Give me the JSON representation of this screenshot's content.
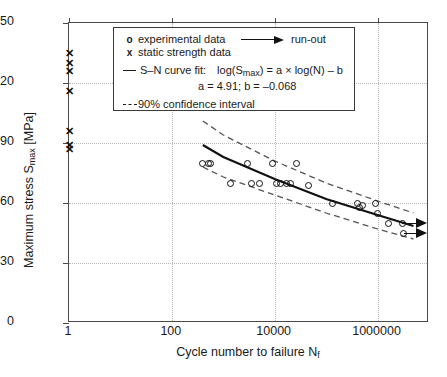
{
  "chart_data": {
    "type": "scatter",
    "title": "",
    "xlabel": "Cycle number to failure Nf",
    "ylabel": "Maximum stress Smax [MPa]",
    "xscale": "log",
    "xlim": [
      1,
      10000000
    ],
    "ylim": [
      0,
      150
    ],
    "xticks": [
      1,
      100,
      10000,
      1000000
    ],
    "xtick_labels": [
      "1",
      "100",
      "10000",
      "1000000"
    ],
    "yticks": [
      0,
      30,
      60,
      90,
      120,
      150
    ],
    "ytick_labels": [
      "0",
      "30",
      "60",
      "90",
      "120",
      "150"
    ],
    "grid": true,
    "legend_position": "top-center",
    "series": [
      {
        "name": "experimental data",
        "marker": "o",
        "points": [
          [
            400,
            80
          ],
          [
            520,
            80
          ],
          [
            560,
            80
          ],
          [
            1400,
            70
          ],
          [
            3000,
            80
          ],
          [
            3500,
            70
          ],
          [
            5000,
            70
          ],
          [
            9000,
            80
          ],
          [
            11000,
            70
          ],
          [
            13000,
            70
          ],
          [
            17000,
            70
          ],
          [
            20000,
            70
          ],
          [
            26000,
            80
          ],
          [
            45000,
            69
          ],
          [
            130000,
            60
          ],
          [
            400000,
            60
          ],
          [
            450000,
            58
          ],
          [
            500000,
            59
          ],
          [
            900000,
            60
          ],
          [
            1000000,
            55
          ],
          [
            1600000,
            50
          ],
          [
            3000000,
            50
          ],
          [
            3200000,
            45
          ]
        ]
      },
      {
        "name": "static strength data",
        "marker": "x",
        "points": [
          [
            1,
            135
          ],
          [
            1,
            130
          ],
          [
            1,
            126
          ],
          [
            1,
            116
          ],
          [
            1,
            96
          ],
          [
            1,
            89
          ],
          [
            1,
            87
          ]
        ]
      },
      {
        "name": "S-N curve fit",
        "marker": "line",
        "points": [
          [
            400,
            89
          ],
          [
            1000,
            83
          ],
          [
            10000,
            72
          ],
          [
            100000,
            62
          ],
          [
            1000000,
            54
          ],
          [
            5000000,
            48.5
          ]
        ]
      },
      {
        "name": "90% confidence interval upper",
        "marker": "dashed",
        "points": [
          [
            400,
            101
          ],
          [
            1000,
            94
          ],
          [
            10000,
            81
          ],
          [
            100000,
            70
          ],
          [
            1000000,
            61
          ],
          [
            5000000,
            55
          ]
        ]
      },
      {
        "name": "90% confidence interval lower",
        "marker": "dashed",
        "points": [
          [
            400,
            78
          ],
          [
            1000,
            73
          ],
          [
            10000,
            64
          ],
          [
            100000,
            55
          ],
          [
            1000000,
            47
          ],
          [
            5000000,
            42
          ]
        ]
      }
    ],
    "runouts": [
      {
        "x": 3000000,
        "y": 50
      },
      {
        "x": 3200000,
        "y": 45
      }
    ]
  },
  "legend": {
    "experimental_symbol": "o",
    "experimental_label": "experimental data",
    "static_symbol": "x",
    "static_label": "static strength data",
    "runout_label": "run-out",
    "fit_label": "S–N curve fit:",
    "fit_equation": "log(Smax) = a × log(N) – b",
    "fit_params": "a = 4.91;   b = –0.068",
    "ci_label": "90% confidence interval"
  },
  "axes": {
    "x_title_main": "Cycle number to failure N",
    "x_title_sub": "f",
    "y_title_main": "Maximum stress S",
    "y_title_sub": "max",
    "y_title_tail": " [MPa]"
  },
  "colors": {
    "frame": "#4a4a4a",
    "grid": "#b9b9b9",
    "data": "#111111",
    "fit": "#111111",
    "ci": "#555555",
    "background": "#ffffff"
  }
}
